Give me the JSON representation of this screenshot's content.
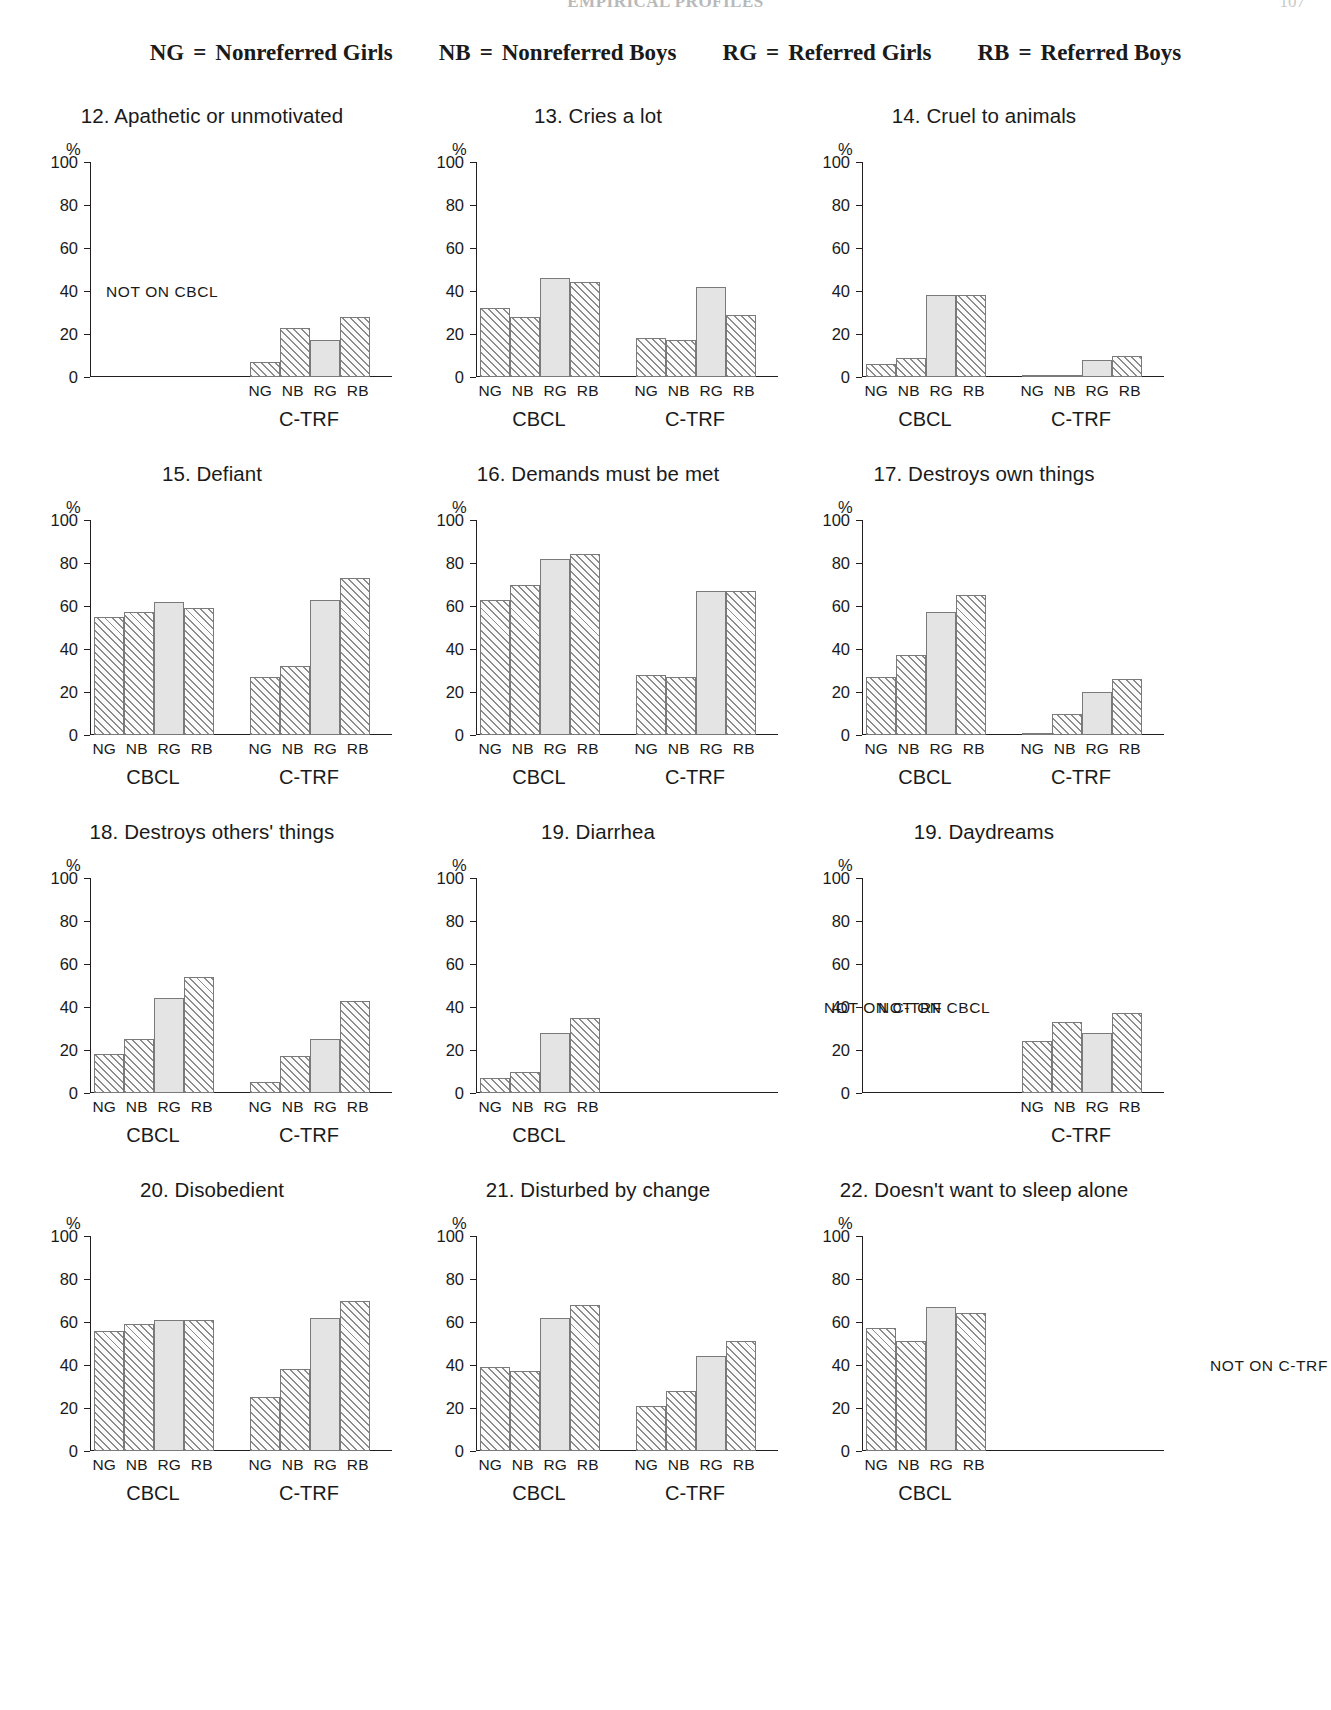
{
  "running_head": {
    "title": "EMPIRICAL PROFILES",
    "page": "107"
  },
  "legend": [
    {
      "code": "NG",
      "eq": "=",
      "label": "Nonreferred Girls"
    },
    {
      "code": "NB",
      "eq": "=",
      "label": "Nonreferred Boys"
    },
    {
      "code": "RG",
      "eq": "=",
      "referred": true,
      "label": "Referred Girls"
    },
    {
      "code": "RB",
      "eq": "=",
      "label": "Referred Boys"
    }
  ],
  "axis": {
    "unit": "%",
    "ticks": [
      "100",
      "80",
      "60",
      "40",
      "20",
      "0"
    ],
    "tick_values": [
      100,
      80,
      60,
      40,
      20,
      0
    ],
    "group_labels": [
      "NG",
      "NB",
      "RG",
      "RB"
    ],
    "instruments": {
      "cbcl": "CBCL",
      "ctrf": "C-TRF"
    },
    "not_on_cbcl": "NOT ON CBCL",
    "not_on_ctrf": "NOT ON C-TRF"
  },
  "chart_data": [
    {
      "id": "item-12",
      "type": "bar",
      "title": "12. Apathetic or unmotivated",
      "ylabel": "%",
      "ylim": [
        0,
        100
      ],
      "grid": false,
      "categories": [
        "NG",
        "NB",
        "RG",
        "RB"
      ],
      "series": [
        {
          "name": "CBCL",
          "missing": true,
          "note": "NOT ON CBCL",
          "values": []
        },
        {
          "name": "C-TRF",
          "missing": false,
          "values": [
            7,
            23,
            17,
            28
          ]
        }
      ]
    },
    {
      "id": "item-13",
      "type": "bar",
      "title": "13. Cries a lot",
      "ylabel": "%",
      "ylim": [
        0,
        100
      ],
      "grid": false,
      "categories": [
        "NG",
        "NB",
        "RG",
        "RB"
      ],
      "series": [
        {
          "name": "CBCL",
          "missing": false,
          "values": [
            32,
            28,
            46,
            44
          ]
        },
        {
          "name": "C-TRF",
          "missing": false,
          "values": [
            18,
            17,
            42,
            29
          ]
        }
      ]
    },
    {
      "id": "item-14",
      "type": "bar",
      "title": "14. Cruel to animals",
      "ylabel": "%",
      "ylim": [
        0,
        100
      ],
      "grid": false,
      "categories": [
        "NG",
        "NB",
        "RG",
        "RB"
      ],
      "series": [
        {
          "name": "CBCL",
          "missing": false,
          "values": [
            6,
            9,
            38,
            38
          ]
        },
        {
          "name": "C-TRF",
          "missing": false,
          "values": [
            1,
            1,
            8,
            10
          ]
        }
      ]
    },
    {
      "id": "item-15",
      "type": "bar",
      "title": "15. Defiant",
      "ylabel": "%",
      "ylim": [
        0,
        100
      ],
      "grid": false,
      "categories": [
        "NG",
        "NB",
        "RG",
        "RB"
      ],
      "series": [
        {
          "name": "CBCL",
          "missing": false,
          "values": [
            55,
            57,
            62,
            59
          ]
        },
        {
          "name": "C-TRF",
          "missing": false,
          "values": [
            27,
            32,
            63,
            73
          ]
        }
      ]
    },
    {
      "id": "item-16",
      "type": "bar",
      "title": "16. Demands must be met",
      "ylabel": "%",
      "ylim": [
        0,
        100
      ],
      "grid": false,
      "categories": [
        "NG",
        "NB",
        "RG",
        "RB"
      ],
      "series": [
        {
          "name": "CBCL",
          "missing": false,
          "values": [
            63,
            70,
            82,
            84
          ]
        },
        {
          "name": "C-TRF",
          "missing": false,
          "values": [
            28,
            27,
            67,
            67
          ]
        }
      ]
    },
    {
      "id": "item-17",
      "type": "bar",
      "title": "17. Destroys own things",
      "ylabel": "%",
      "ylim": [
        0,
        100
      ],
      "grid": false,
      "categories": [
        "NG",
        "NB",
        "RG",
        "RB"
      ],
      "series": [
        {
          "name": "CBCL",
          "missing": false,
          "values": [
            27,
            37,
            57,
            65
          ]
        },
        {
          "name": "C-TRF",
          "missing": false,
          "values": [
            1,
            10,
            20,
            26
          ]
        }
      ]
    },
    {
      "id": "item-18",
      "type": "bar",
      "title": "18. Destroys others' things",
      "ylabel": "%",
      "ylim": [
        0,
        100
      ],
      "grid": false,
      "categories": [
        "NG",
        "NB",
        "RG",
        "RB"
      ],
      "series": [
        {
          "name": "CBCL",
          "missing": false,
          "values": [
            18,
            25,
            44,
            54
          ]
        },
        {
          "name": "C-TRF",
          "missing": false,
          "values": [
            5,
            17,
            25,
            43
          ]
        }
      ]
    },
    {
      "id": "item-19-diarrhea",
      "type": "bar",
      "title": "19. Diarrhea",
      "ylabel": "%",
      "ylim": [
        0,
        100
      ],
      "grid": false,
      "categories": [
        "NG",
        "NB",
        "RG",
        "RB"
      ],
      "series": [
        {
          "name": "CBCL",
          "missing": false,
          "values": [
            7,
            10,
            28,
            35
          ]
        },
        {
          "name": "C-TRF",
          "missing": true,
          "note": "NOT ON C-TRF",
          "values": []
        }
      ]
    },
    {
      "id": "item-19-daydreams",
      "type": "bar",
      "title": "19. Daydreams",
      "ylabel": "%",
      "ylim": [
        0,
        100
      ],
      "grid": false,
      "categories": [
        "NG",
        "NB",
        "RG",
        "RB"
      ],
      "series": [
        {
          "name": "CBCL",
          "missing": true,
          "note": "NOT ON CBCL",
          "values": []
        },
        {
          "name": "C-TRF",
          "missing": false,
          "values": [
            24,
            33,
            28,
            37
          ]
        }
      ]
    },
    {
      "id": "item-20",
      "type": "bar",
      "title": "20. Disobedient",
      "ylabel": "%",
      "ylim": [
        0,
        100
      ],
      "grid": false,
      "categories": [
        "NG",
        "NB",
        "RG",
        "RB"
      ],
      "series": [
        {
          "name": "CBCL",
          "missing": false,
          "values": [
            56,
            59,
            61,
            61
          ]
        },
        {
          "name": "C-TRF",
          "missing": false,
          "values": [
            25,
            38,
            62,
            70
          ]
        }
      ]
    },
    {
      "id": "item-21",
      "type": "bar",
      "title": "21. Disturbed by change",
      "ylabel": "%",
      "ylim": [
        0,
        100
      ],
      "grid": false,
      "categories": [
        "NG",
        "NB",
        "RG",
        "RB"
      ],
      "series": [
        {
          "name": "CBCL",
          "missing": false,
          "values": [
            39,
            37,
            62,
            68
          ]
        },
        {
          "name": "C-TRF",
          "missing": false,
          "values": [
            21,
            28,
            44,
            51
          ]
        }
      ]
    },
    {
      "id": "item-22",
      "type": "bar",
      "title": "22. Doesn't want to sleep alone",
      "ylabel": "%",
      "ylim": [
        0,
        100
      ],
      "grid": false,
      "categories": [
        "NG",
        "NB",
        "RG",
        "RB"
      ],
      "series": [
        {
          "name": "CBCL",
          "missing": false,
          "values": [
            57,
            51,
            67,
            64
          ]
        },
        {
          "name": "C-TRF",
          "missing": true,
          "note": "NOT ON C-TRF",
          "values": []
        }
      ]
    }
  ]
}
